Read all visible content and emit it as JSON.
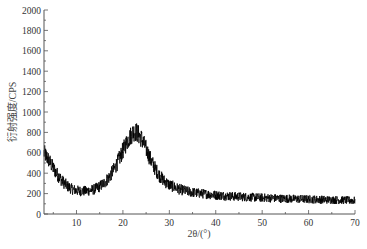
{
  "chart_data": {
    "type": "line",
    "title": "",
    "xlabel": "2θ/(°)",
    "ylabel": "衍射强度/CPS",
    "xlim": [
      3,
      70
    ],
    "ylim": [
      0,
      2000
    ],
    "x_ticks": [
      10,
      20,
      30,
      40,
      50,
      60,
      70
    ],
    "x_minor_step": 5,
    "y_ticks": [
      0,
      200,
      400,
      600,
      800,
      1000,
      1200,
      1400,
      1600,
      1800,
      2000
    ],
    "y_minor_step": 100,
    "grid": false,
    "legend": null,
    "series": [
      {
        "name": "XRD pattern",
        "color": "#000000",
        "noise_amplitude": 60,
        "x": [
          3,
          4,
          5,
          6,
          7,
          8,
          9,
          10,
          11,
          12,
          13,
          14,
          15,
          16,
          17,
          18,
          19,
          20,
          21,
          22,
          22.5,
          23,
          24,
          25,
          26,
          27,
          28,
          29,
          30,
          32,
          34,
          36,
          38,
          40,
          42,
          44,
          46,
          48,
          50,
          52,
          54,
          56,
          58,
          60,
          62,
          64,
          66,
          68,
          70
        ],
        "y": [
          600,
          530,
          450,
          380,
          320,
          275,
          245,
          230,
          225,
          225,
          232,
          245,
          270,
          305,
          360,
          430,
          520,
          620,
          720,
          790,
          810,
          800,
          740,
          640,
          530,
          440,
          370,
          320,
          285,
          245,
          220,
          205,
          195,
          185,
          178,
          172,
          168,
          163,
          160,
          156,
          152,
          150,
          147,
          145,
          142,
          140,
          138,
          135,
          132
        ]
      }
    ]
  }
}
